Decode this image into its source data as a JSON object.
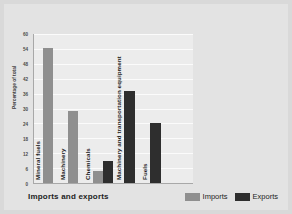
{
  "chart_data": {
    "type": "bar",
    "title": "Imports and exports",
    "xlabel": "",
    "ylabel": "Percentage of total",
    "ylim": [
      0,
      60
    ],
    "yticks": [
      60,
      54,
      48,
      42,
      36,
      30,
      24,
      18,
      12,
      6,
      0
    ],
    "grid": true,
    "legend_position": "bottom-right",
    "categories": [
      "Mineral fuels",
      "Machinery",
      "Chemicals",
      "Machinery and transportation equipment",
      "Fuels"
    ],
    "series": [
      {
        "name": "Imports",
        "color": "#8f8f8f",
        "values": [
          54,
          29,
          5,
          null,
          null
        ]
      },
      {
        "name": "Exports",
        "color": "#2e2e2e",
        "values": [
          null,
          null,
          9,
          37,
          24
        ]
      }
    ],
    "bars": [
      {
        "category": "Mineral fuels",
        "series": "Imports",
        "value": 54
      },
      {
        "category": "Machinery",
        "series": "Imports",
        "value": 29
      },
      {
        "category": "Chemicals",
        "series": "Imports",
        "value": 5
      },
      {
        "category": "Chemicals",
        "series": "Exports",
        "value": 9
      },
      {
        "category": "Machinery and transportation equipment",
        "series": "Exports",
        "value": 37
      },
      {
        "category": "Fuels",
        "series": "Exports",
        "value": 24
      }
    ]
  },
  "legend": {
    "imports": {
      "label": "Imports",
      "color": "#8f8f8f"
    },
    "exports": {
      "label": "Exports",
      "color": "#2e2e2e"
    }
  },
  "axis": {
    "y_title": "Percentage of total",
    "ticks": [
      "60",
      "54",
      "48",
      "42",
      "36",
      "30",
      "24",
      "18",
      "12",
      "6",
      "0"
    ]
  },
  "labels": {
    "title": "Imports and exports",
    "cat0": "Mineral fuels",
    "cat1": "Machinery",
    "cat2": "Chemicals",
    "cat3": "Machinery and transportation equipment",
    "cat4": "Fuels"
  }
}
